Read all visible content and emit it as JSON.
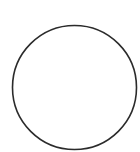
{
  "canvas": {
    "width": 140,
    "height": 152,
    "background": "#ffffff"
  },
  "shapes": [
    {
      "type": "circle",
      "cx": 74.5,
      "cy": 87.5,
      "r": 62,
      "stroke": "#2b2b2b",
      "stroke_width": 1.6,
      "fill": "none"
    }
  ]
}
